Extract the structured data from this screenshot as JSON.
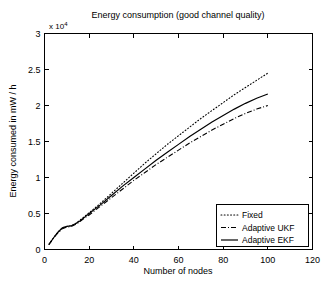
{
  "chart_data": {
    "type": "line",
    "title": "Energy consumption (good channel quality)",
    "xlabel": "Number of nodes",
    "ylabel": "Energy consumed in mW / h",
    "y_multiplier_label": "x 10",
    "y_multiplier_exponent": "4",
    "xlim": [
      0,
      120
    ],
    "ylim": [
      0,
      3
    ],
    "xticks": [
      0,
      20,
      40,
      60,
      80,
      100,
      120
    ],
    "xtick_labels": [
      "0",
      "20",
      "40",
      "60",
      "80",
      "100",
      "120"
    ],
    "yticks": [
      0,
      0.5,
      1,
      1.5,
      2,
      2.5,
      3
    ],
    "ytick_labels": [
      "0",
      "0.5",
      "1",
      "1.5",
      "2",
      "2.5",
      "3"
    ],
    "grid": false,
    "legend_position": "lower right",
    "x": [
      2,
      4,
      6,
      8,
      10,
      12,
      14,
      16,
      18,
      20,
      25,
      30,
      35,
      40,
      45,
      50,
      55,
      60,
      65,
      70,
      75,
      80,
      85,
      90,
      95,
      100
    ],
    "series": [
      {
        "name": "Fixed",
        "style": "dotted",
        "color": "#000000",
        "values": [
          0.07,
          0.16,
          0.24,
          0.3,
          0.32,
          0.33,
          0.36,
          0.41,
          0.46,
          0.51,
          0.64,
          0.78,
          0.92,
          1.06,
          1.2,
          1.33,
          1.46,
          1.58,
          1.7,
          1.82,
          1.93,
          2.04,
          2.15,
          2.25,
          2.35,
          2.45
        ]
      },
      {
        "name": "Adaptive UKF",
        "style": "dashdot",
        "color": "#000000",
        "values": [
          0.07,
          0.16,
          0.23,
          0.29,
          0.31,
          0.32,
          0.35,
          0.39,
          0.44,
          0.48,
          0.6,
          0.72,
          0.84,
          0.96,
          1.07,
          1.18,
          1.28,
          1.38,
          1.48,
          1.57,
          1.66,
          1.74,
          1.82,
          1.89,
          1.95,
          2.0
        ]
      },
      {
        "name": "Adaptive EKF",
        "style": "solid",
        "color": "#000000",
        "values": [
          0.07,
          0.16,
          0.24,
          0.3,
          0.32,
          0.33,
          0.36,
          0.4,
          0.45,
          0.5,
          0.62,
          0.75,
          0.88,
          1.0,
          1.12,
          1.24,
          1.35,
          1.46,
          1.57,
          1.67,
          1.77,
          1.86,
          1.95,
          2.03,
          2.1,
          2.16
        ]
      }
    ],
    "legend_entries": [
      {
        "label": "Fixed",
        "style": "dotted"
      },
      {
        "label": "Adaptive UKF",
        "style": "dashdot"
      },
      {
        "label": "Adaptive EKF",
        "style": "solid"
      }
    ]
  }
}
